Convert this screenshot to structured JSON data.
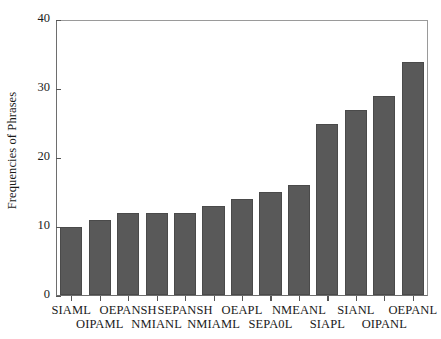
{
  "chart_data": {
    "type": "bar",
    "title": "",
    "subtitle": "",
    "xlabel": "",
    "ylabel": "Frequencies of Phrases",
    "ylim": [
      0,
      40
    ],
    "yticks": [
      0,
      10,
      20,
      30,
      40
    ],
    "grid": false,
    "legend": null,
    "bar_color": "#595959",
    "bar_edge_color": "#4a4a4a",
    "axis_color": "#6e6e6e",
    "text_color": "#1a1a1a",
    "background": "#ffffff",
    "categories": [
      "SIAML",
      "OIPAML",
      "OEPANSH",
      "NMIANL",
      "SEPANSH",
      "NMIAML",
      "OEAPL",
      "SEPA0L",
      "NMEANL",
      "SIAPL",
      "SIANL",
      "OIPANL",
      "OEPANL"
    ],
    "values": [
      10,
      11,
      12,
      12,
      12,
      13,
      14,
      15,
      16,
      25,
      27,
      29,
      34
    ],
    "label_rows": [
      0,
      1,
      0,
      1,
      0,
      1,
      0,
      1,
      0,
      1,
      0,
      1,
      0
    ],
    "n_bars": 13,
    "annotations": []
  }
}
